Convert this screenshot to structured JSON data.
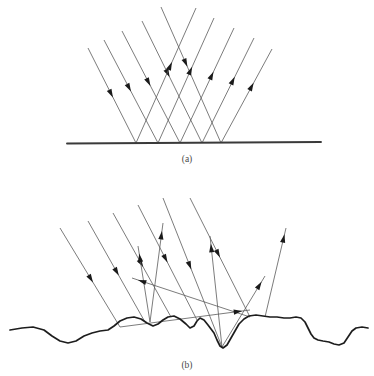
{
  "figure": {
    "background_color": "#ffffff",
    "width": 374,
    "height": 376,
    "ray_color": "#5a5a5a",
    "arrow_color": "#1a1a1a",
    "surface_color": "#1d1d1d",
    "mirror_color": "#3a3a3a"
  },
  "panels": [
    {
      "id": "panel-a",
      "caption": "(a)",
      "caption_x": 187,
      "caption_y": 162,
      "surface_type": "flat-mirror",
      "description": "Specular reflection from a smooth flat surface: parallel incident rays reflect as parallel rays at the mirror angle.",
      "mirror": {
        "x1": 67,
        "y1": 143.5,
        "x2": 321,
        "y2": 142.0
      },
      "incident_rays": [
        {
          "x1": 88,
          "y1": 48,
          "x2": 136,
          "y2": 143,
          "arrow_t": 0.52
        },
        {
          "x1": 104,
          "y1": 40,
          "x2": 158,
          "y2": 143,
          "arrow_t": 0.5
        },
        {
          "x1": 122,
          "y1": 31,
          "x2": 180,
          "y2": 143,
          "arrow_t": 0.49
        },
        {
          "x1": 142,
          "y1": 21,
          "x2": 202,
          "y2": 143,
          "arrow_t": 0.46
        },
        {
          "x1": 161,
          "y1": 7,
          "x2": 221,
          "y2": 143,
          "arrow_t": 0.44
        }
      ],
      "reflected_rays": [
        {
          "x1": 136,
          "y1": 143,
          "x2": 196,
          "y2": 8,
          "arrow_t": 0.6
        },
        {
          "x1": 158,
          "y1": 143,
          "x2": 214,
          "y2": 18,
          "arrow_t": 0.61
        },
        {
          "x1": 180,
          "y1": 143,
          "x2": 234,
          "y2": 28,
          "arrow_t": 0.62
        },
        {
          "x1": 202,
          "y1": 143,
          "x2": 254,
          "y2": 38,
          "arrow_t": 0.63
        },
        {
          "x1": 221,
          "y1": 143,
          "x2": 272,
          "y2": 49,
          "arrow_t": 0.64
        }
      ]
    },
    {
      "id": "panel-b",
      "caption": "(b)",
      "caption_x": 187,
      "caption_y": 368,
      "surface_type": "rough-surface",
      "description": "Diffuse reflection from a rough surface: parallel incident rays scatter into many different directions.",
      "surface_path": "M 10,330 L 22,328 L 33,327 L 44,330 L 52,336 L 60,341 L 68,343 L 76,341 L 84,336 L 92,333 L 100,331 L 108,330 L 114,326 L 120,321 L 127,318 L 134,317 L 141,319 L 147,323 L 153,326 L 158,324 L 163,320 L 168,317 L 174,316 L 180,319 L 186,324 L 190,328 L 194,326 L 197,321 L 200,318 L 204,320 L 208,325 L 211,329 L 214,333 L 217,340 L 220,346 L 223,348 L 227,345 L 231,338 L 235,331 L 239,324 L 244,319 L 249,316 L 256,315 L 263,316 L 270,317 L 277,317 L 284,318 L 290,318 L 296,317 L 301,318 L 305,322 L 308,328 L 311,334 L 314,338 L 318,340 L 323,341 L 329,342 L 334,344 L 339,345 L 344,343 L 348,337 L 352,331 L 356,328 L 362,327 L 368,328",
      "incident_rays": [
        {
          "x1": 60,
          "y1": 228,
          "x2": 120,
          "y2": 327,
          "arrow_t": 0.55
        },
        {
          "x1": 88,
          "y1": 221,
          "x2": 145,
          "y2": 322,
          "arrow_t": 0.54
        },
        {
          "x1": 113,
          "y1": 213,
          "x2": 171,
          "y2": 317,
          "arrow_t": 0.52
        },
        {
          "x1": 138,
          "y1": 205,
          "x2": 197,
          "y2": 320,
          "arrow_t": 0.5
        },
        {
          "x1": 163,
          "y1": 198,
          "x2": 222,
          "y2": 347,
          "arrow_t": 0.48
        },
        {
          "x1": 190,
          "y1": 198,
          "x2": 250,
          "y2": 317,
          "arrow_t": 0.5
        }
      ],
      "scattered_rays": [
        {
          "x1": 150,
          "y1": 322,
          "x2": 163,
          "y2": 223,
          "arrow_t": 0.92
        },
        {
          "x1": 150,
          "y1": 322,
          "x2": 138,
          "y2": 246,
          "arrow_t": 0.9
        },
        {
          "x1": 222,
          "y1": 347,
          "x2": 210,
          "y2": 236,
          "arrow_t": 0.93
        },
        {
          "x1": 222,
          "y1": 347,
          "x2": 265,
          "y2": 276,
          "arrow_t": 0.92
        },
        {
          "x1": 265,
          "y1": 317,
          "x2": 286,
          "y2": 228,
          "arrow_t": 0.93
        },
        {
          "x1": 250,
          "y1": 317,
          "x2": 132,
          "y2": 278,
          "arrow_t": 0.95
        },
        {
          "x1": 120,
          "y1": 327,
          "x2": 250,
          "y2": 310,
          "arrow_t": 0.94
        }
      ]
    }
  ]
}
